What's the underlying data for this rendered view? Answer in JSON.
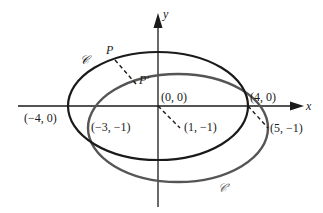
{
  "diagram": {
    "type": "ellipse-translation",
    "axes": {
      "x_label": "x",
      "y_label": "y"
    },
    "curves": [
      {
        "name": "C",
        "label": "𝒞",
        "color": "#1a1a1a",
        "center": [
          0,
          0
        ],
        "semi_axes": [
          4,
          2.5
        ]
      },
      {
        "name": "C'",
        "label": "𝒞′",
        "color": "#555555",
        "center": [
          1,
          -1
        ],
        "semi_axes": [
          4,
          2.5
        ]
      }
    ],
    "points": {
      "P": "P",
      "P_prime": "P′",
      "origin": "(0, 0)",
      "origin_image": "(1, −1)",
      "right_vertex": "(4, 0)",
      "right_vertex_image": "(5, −1)",
      "left_vertex": "(−4, 0)",
      "left_vertex_image": "(−3, −1)"
    },
    "colors": {
      "curve_c": "#1a1a1a",
      "curve_c_prime": "#555555",
      "axes": "#1a1a1a"
    }
  }
}
